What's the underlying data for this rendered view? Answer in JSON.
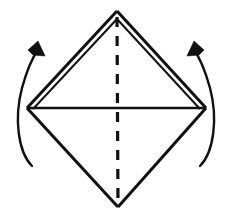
{
  "figure": {
    "title": "Origami fold step diagram",
    "background_color": "#ffffff",
    "ink_color": "#111111"
  },
  "canvas": {
    "width": 232,
    "height": 223
  },
  "vertices": {
    "top": {
      "label": "top-apex",
      "x": 117,
      "y": 11
    },
    "left": {
      "label": "left-vertex",
      "x": 27,
      "y": 108
    },
    "right": {
      "label": "right-vertex",
      "x": 206,
      "y": 108
    },
    "bottom": {
      "label": "bottom-apex",
      "x": 118,
      "y": 207
    }
  },
  "shapes": {
    "upper_left_edge_outer": {
      "name": "upper-left-edge-outer",
      "points": "27,108 117,11"
    },
    "upper_left_edge_inner": {
      "name": "upper-left-edge-inner",
      "points": "33,109 117,19"
    },
    "upper_right_edge_outer": {
      "name": "upper-right-edge-outer",
      "points": "117,11 206,108"
    },
    "upper_right_edge_inner": {
      "name": "upper-right-edge-inner",
      "points": "117,19 200,109"
    },
    "lower_left_edge": {
      "name": "lower-left-edge",
      "points": "27,108 118,207"
    },
    "lower_right_edge": {
      "name": "lower-right-edge",
      "points": "118,207 206,108"
    },
    "horizontal_crease": {
      "name": "horizontal-crease",
      "points": "28,108 205,108",
      "style": "solid"
    },
    "vertical_crease": {
      "name": "vertical-crease",
      "points": "117,17 118,205",
      "style": "dashed",
      "dash_pattern": "10 9"
    }
  },
  "arrows": {
    "left": {
      "name": "left-rotation-arrow",
      "arc_path": "M 32,166 C 18,152 14,118 22,88 C 27,70 32,58 38,50",
      "head_points": "38,41 45,56 33,55 28,50",
      "direction": "counterclockwise-up",
      "meaning": "fold left flap upward"
    },
    "right": {
      "name": "right-rotation-arrow",
      "arc_path": "M 200,166 C 214,152 218,118 210,88 C 205,70 200,58 194,50",
      "head_points": "194,41 187,56 199,55 204,50",
      "direction": "clockwise-up",
      "meaning": "fold right flap upward"
    }
  },
  "stroke_widths": {
    "sheet_edge": 3,
    "inner_edge": 2,
    "crease_solid": 2.4,
    "crease_dashed": 3.2,
    "arc": 2.4
  }
}
